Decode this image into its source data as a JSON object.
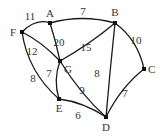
{
  "graph": {
    "type": "weighted-undirected",
    "vertices": [
      {
        "id": "A",
        "x": 50,
        "y": 23,
        "lx": 50,
        "ly": 17,
        "anchor": "middle"
      },
      {
        "id": "B",
        "x": 115,
        "y": 23,
        "lx": 115,
        "ly": 16,
        "anchor": "middle"
      },
      {
        "id": "C",
        "x": 144,
        "y": 69,
        "lx": 148,
        "ly": 73,
        "anchor": "start"
      },
      {
        "id": "D",
        "x": 106,
        "y": 117,
        "lx": 106,
        "ly": 131,
        "anchor": "middle"
      },
      {
        "id": "E",
        "x": 59,
        "y": 99,
        "lx": 59,
        "ly": 112,
        "anchor": "middle"
      },
      {
        "id": "F",
        "x": 22,
        "y": 32,
        "lx": 16,
        "ly": 36,
        "anchor": "end"
      },
      {
        "id": "G",
        "x": 60,
        "y": 61,
        "lx": 64,
        "ly": 73,
        "anchor": "start"
      }
    ],
    "edges": [
      {
        "from": "F",
        "to": "A",
        "weight": "11",
        "path": "M22,32 Q36,18 50,23",
        "lx": 30,
        "ly": 20
      },
      {
        "from": "A",
        "to": "B",
        "weight": "7",
        "path": "M50,23 Q82,14 115,23",
        "lx": 83,
        "ly": 15
      },
      {
        "from": "A",
        "to": "G",
        "weight": "20",
        "path": "M50,23 Q56,42 60,61",
        "lx": 59,
        "ly": 46
      },
      {
        "from": "F",
        "to": "G",
        "weight": "12",
        "path": "M22,32 Q42,42 60,61",
        "lx": 32,
        "ly": 55
      },
      {
        "from": "B",
        "to": "G",
        "weight": "15",
        "path": "M115,23 Q90,44 60,61",
        "lx": 86,
        "ly": 51
      },
      {
        "from": "B",
        "to": "C",
        "weight": "10",
        "path": "M115,23 Q138,40 144,69",
        "lx": 136,
        "ly": 44
      },
      {
        "from": "B",
        "to": "D",
        "weight": "8",
        "path": "M115,23 Q110,70 106,117",
        "lx": 97,
        "ly": 77
      },
      {
        "from": "F",
        "to": "E",
        "weight": "8",
        "path": "M22,32 Q28,72 59,99",
        "lx": 33,
        "ly": 82
      },
      {
        "from": "G",
        "to": "E",
        "weight": "7",
        "path": "M60,61 Q53,80 59,99",
        "lx": 49,
        "ly": 77
      },
      {
        "from": "G",
        "to": "D",
        "weight": "9",
        "path": "M60,61 Q82,96 106,117",
        "lx": 82,
        "ly": 94
      },
      {
        "from": "E",
        "to": "D",
        "weight": "6",
        "path": "M59,99 Q83,102 106,117",
        "lx": 78,
        "ly": 119
      },
      {
        "from": "C",
        "to": "D",
        "weight": "7",
        "path": "M144,69 Q121,87 106,117",
        "lx": 125,
        "ly": 97
      }
    ]
  }
}
